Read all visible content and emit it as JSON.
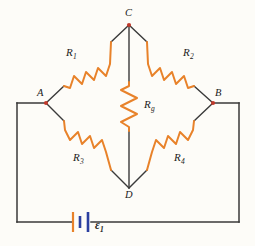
{
  "figure": {
    "kind": "circuit-diagram",
    "name": "Wheatstone bridge",
    "background_color": "#fdfcf8",
    "wire_color": "#3a3a3a",
    "resistor_color": "#e8822a",
    "node_dot_color": "#c0392b",
    "battery_plate_colors": [
      "#e8822a",
      "#2b3fa0"
    ]
  },
  "nodes": [
    {
      "id": "C",
      "label": "C",
      "x": 129,
      "y": 25,
      "dot": true
    },
    {
      "id": "A",
      "label": "A",
      "x": 46,
      "y": 103,
      "dot": true
    },
    {
      "id": "B",
      "label": "B",
      "x": 213,
      "y": 103,
      "dot": true
    },
    {
      "id": "D",
      "label": "D",
      "x": 129,
      "y": 188,
      "dot": false
    }
  ],
  "node_labels": {
    "C": "C",
    "A": "A",
    "B": "B",
    "D": "D"
  },
  "resistors": [
    {
      "id": "R1",
      "label": "R",
      "sub": "1",
      "between": [
        "A",
        "C"
      ],
      "branch": "upper-left"
    },
    {
      "id": "R2",
      "label": "R",
      "sub": "2",
      "between": [
        "C",
        "B"
      ],
      "branch": "upper-right"
    },
    {
      "id": "Rg",
      "label": "R",
      "sub": "g",
      "between": [
        "C",
        "D"
      ],
      "branch": "bridge-center"
    },
    {
      "id": "R3",
      "label": "R",
      "sub": "3",
      "between": [
        "A",
        "D"
      ],
      "branch": "lower-left"
    },
    {
      "id": "R4",
      "label": "R",
      "sub": "4",
      "between": [
        "D",
        "B"
      ],
      "branch": "lower-right"
    }
  ],
  "source": {
    "id": "emf1",
    "label": "ε",
    "sub": "1",
    "type": "battery",
    "location": "bottom-outer-loop"
  }
}
